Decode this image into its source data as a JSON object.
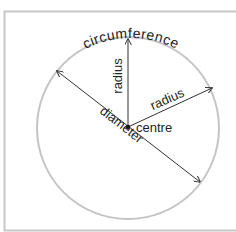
{
  "diagram": {
    "labels": {
      "circumference": "circumference",
      "radius_vertical": "radius",
      "radius_diagonal": "radius",
      "diameter": "diameter",
      "centre": "centre"
    },
    "colors": {
      "frame": "#c8c8c8",
      "circle": "#c4c4c4",
      "lines": "#333333",
      "text": "#222222",
      "background": "#ffffff"
    }
  }
}
